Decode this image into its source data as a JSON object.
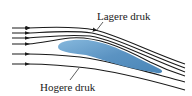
{
  "diagram": {
    "labels": {
      "upper": "Lagere druk",
      "lower": "Hogere druk"
    },
    "colors": {
      "airfoil_light": "#7fb0d6",
      "airfoil_dark": "#4a86b8",
      "streamline": "#1a1a1a",
      "background": "#ffffff"
    },
    "streamline_count": 6
  }
}
